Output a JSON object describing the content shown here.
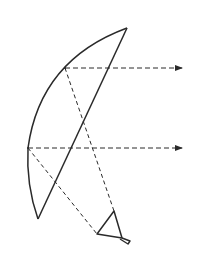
{
  "diagram": {
    "type": "offset-fed parabolic reflector antenna ray diagram",
    "colors": {
      "background": "#ffffff",
      "stroke": "#2a2a2a"
    },
    "reflector": {
      "top_tip": [
        127,
        28
      ],
      "bottom_tip": [
        38,
        219
      ],
      "arc_points": [
        [
          65,
          68
        ],
        [
          28,
          148
        ]
      ]
    },
    "rays": [
      {
        "name": "upper-ray",
        "origin": [
          65,
          68
        ],
        "end": [
          182,
          68
        ],
        "to_feed": [
          114,
          211
        ]
      },
      {
        "name": "lower-ray",
        "origin": [
          28,
          148
        ],
        "end": [
          182,
          148
        ],
        "to_feed": [
          97,
          234
        ]
      }
    ],
    "feed_horn": {
      "vertices": [
        [
          97,
          234
        ],
        [
          114,
          211
        ],
        [
          122,
          238
        ]
      ],
      "tail": [
        [
          122,
          238
        ],
        [
          130,
          243
        ]
      ]
    }
  }
}
